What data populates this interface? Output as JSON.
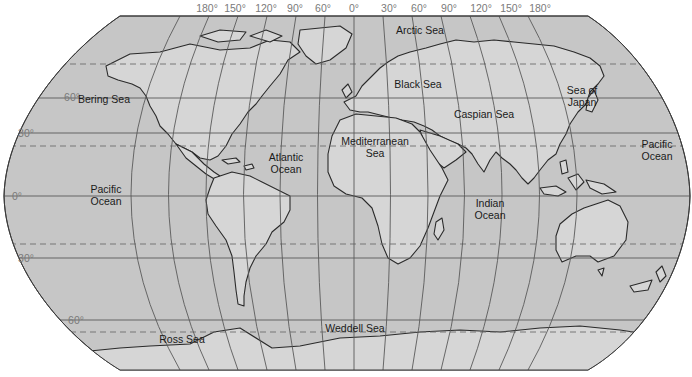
{
  "map": {
    "projection": "Robinson",
    "colors": {
      "ocean": "#c6c6c6",
      "land": "#d6d6d6",
      "coast": "#2a2a2a",
      "grid": "#5a5a5a",
      "dashed": "#6e6e6e",
      "degree_label": "#7a7a7a",
      "label": "#1a1a1a"
    },
    "longitude_labels": [
      {
        "text": "180°",
        "x": 207
      },
      {
        "text": "150°",
        "x": 234
      },
      {
        "text": "120°",
        "x": 265
      },
      {
        "text": "90°",
        "x": 294
      },
      {
        "text": "60°",
        "x": 322
      },
      {
        "text": "30°",
        "x": 322
      },
      {
        "text": "0°",
        "x": 354
      },
      {
        "text": "30°",
        "x": 389
      },
      {
        "text": "60°",
        "x": 419
      },
      {
        "text": "90°",
        "x": 449
      },
      {
        "text": "120°",
        "x": 481
      },
      {
        "text": "150°",
        "x": 511
      },
      {
        "text": "180°",
        "x": 540
      }
    ],
    "latitude_labels": [
      {
        "text": "60°",
        "y": 97
      },
      {
        "text": "30°",
        "y": 133
      },
      {
        "text": "0°",
        "y": 196
      },
      {
        "text": "30°",
        "y": 258
      },
      {
        "text": "60°",
        "y": 320
      }
    ],
    "water_labels": [
      {
        "lines": [
          "Arctic Sea"
        ],
        "x": 420,
        "y": 31
      },
      {
        "lines": [
          "Bering Sea"
        ],
        "x": 104,
        "y": 100
      },
      {
        "lines": [
          "Black Sea"
        ],
        "x": 418,
        "y": 85
      },
      {
        "lines": [
          "Sea of",
          "Japan"
        ],
        "x": 582,
        "y": 92
      },
      {
        "lines": [
          "Caspian Sea"
        ],
        "x": 482,
        "y": 115
      },
      {
        "lines": [
          "Mediterranean",
          "Sea"
        ],
        "x": 375,
        "y": 144
      },
      {
        "lines": [
          "Atlantic",
          "Ocean"
        ],
        "x": 286,
        "y": 160
      },
      {
        "lines": [
          "Pacific",
          "Ocean"
        ],
        "x": 106,
        "y": 193
      },
      {
        "lines": [
          "Pacific",
          "Ocean"
        ],
        "x": 658,
        "y": 147
      },
      {
        "lines": [
          "Indian",
          "Ocean"
        ],
        "x": 490,
        "y": 206
      },
      {
        "lines": [
          "Weddell Sea"
        ],
        "x": 355,
        "y": 331
      },
      {
        "lines": [
          "Ross Sea"
        ],
        "x": 182,
        "y": 343
      }
    ]
  }
}
